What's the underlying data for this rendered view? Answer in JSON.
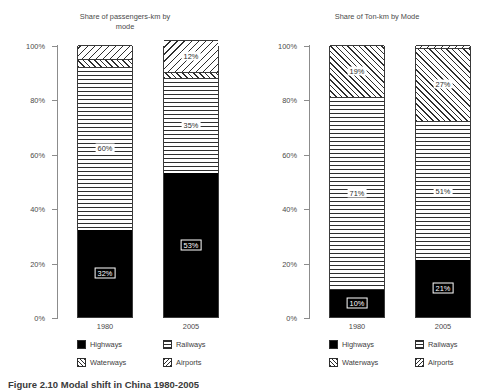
{
  "caption": "Figure 2.10  Modal shift in China 1980-2005",
  "legend": {
    "items": [
      {
        "label": "Highways",
        "pattern": "solid-black",
        "swatch_icon": "solid-swatch-icon"
      },
      {
        "label": "Railways",
        "pattern": "horizontal-lines",
        "swatch_icon": "horizontal-hatch-swatch-icon"
      },
      {
        "label": "Waterways",
        "pattern": "back-diagonal-lines",
        "swatch_icon": "back-diagonal-hatch-swatch-icon"
      },
      {
        "label": "Airports",
        "pattern": "forward-diagonal-lines",
        "swatch_icon": "forward-diagonal-hatch-swatch-icon"
      }
    ]
  },
  "colors": {
    "background": "#ffffff",
    "axis": "#8c8c8c",
    "text": "#4a4a4a",
    "bar_outline": "#3a3a3a",
    "hatch": "#2e2e2e",
    "highways_fill": "#000000"
  },
  "chart_data": [
    {
      "type": "bar",
      "subtype": "stacked-percentage",
      "title": "Share of passengers-km by\nmode",
      "xlabel": "",
      "ylabel": "",
      "ylim": [
        0,
        100
      ],
      "ytick_labels": [
        "0%",
        "20%",
        "40%",
        "60%",
        "80%",
        "100%"
      ],
      "ytick_values": [
        0,
        20,
        40,
        60,
        80,
        100
      ],
      "grid": false,
      "legend_position": "bottom",
      "categories": [
        "1980",
        "2005"
      ],
      "series": [
        {
          "name": "Highways",
          "values": [
            32,
            53
          ],
          "labels": [
            "32%",
            "53%"
          ]
        },
        {
          "name": "Railways",
          "values": [
            60,
            35
          ],
          "labels": [
            "60%",
            "35%"
          ]
        },
        {
          "name": "Waterways",
          "values": [
            3,
            2
          ],
          "labels": [
            "",
            ""
          ]
        },
        {
          "name": "Airports",
          "values": [
            5,
            12
          ],
          "labels": [
            "",
            "12%"
          ]
        }
      ]
    },
    {
      "type": "bar",
      "subtype": "stacked-percentage",
      "title": "Share of Ton-km by Mode",
      "xlabel": "",
      "ylabel": "",
      "ylim": [
        0,
        100
      ],
      "ytick_labels": [
        "0%",
        "20%",
        "40%",
        "60%",
        "80%",
        "100%"
      ],
      "ytick_values": [
        0,
        20,
        40,
        60,
        80,
        100
      ],
      "grid": false,
      "legend_position": "bottom",
      "categories": [
        "1980",
        "2005"
      ],
      "series": [
        {
          "name": "Highways",
          "values": [
            10,
            21
          ],
          "labels": [
            "10%",
            "21%"
          ]
        },
        {
          "name": "Railways",
          "values": [
            71,
            51
          ],
          "labels": [
            "71%",
            "51%"
          ]
        },
        {
          "name": "Waterways",
          "values": [
            19,
            27
          ],
          "labels": [
            "19%",
            "27%"
          ]
        },
        {
          "name": "Airports",
          "values": [
            0,
            1
          ],
          "labels": [
            "",
            ""
          ]
        }
      ]
    }
  ]
}
